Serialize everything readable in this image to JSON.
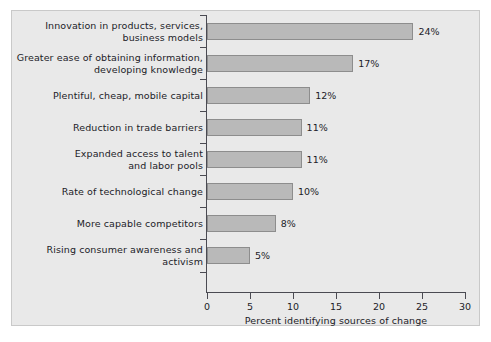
{
  "chart_data": {
    "type": "bar",
    "orientation": "horizontal",
    "title": "",
    "xlabel": "Percent identifying sources of change",
    "ylabel": "",
    "xlim": [
      0,
      30
    ],
    "xticks": [
      0,
      5,
      10,
      15,
      20,
      25,
      30
    ],
    "grid": false,
    "legend": null,
    "value_suffix": "%",
    "categories": [
      "Innovation in products, services,\nbusiness models",
      "Greater ease of obtaining information,\ndeveloping knowledge",
      "Plentiful, cheap, mobile capital",
      "Reduction in trade barriers",
      "Expanded access to talent\nand labor pools",
      "Rate of technological change",
      "More capable competitors",
      "Rising consumer awareness and\nactivism"
    ],
    "values": [
      24,
      17,
      12,
      11,
      11,
      10,
      8,
      5
    ],
    "value_labels": [
      "24%",
      "17%",
      "12%",
      "11%",
      "11%",
      "10%",
      "8%",
      "5%"
    ]
  },
  "style": {
    "panel_background": "#e9e9e9",
    "figure_background": "#ffffff",
    "bar_fill": "#b9b9b9",
    "bar_border": "#8d8d8d",
    "axis_color": "#4a4a52",
    "text_color": "#1c1c28"
  }
}
